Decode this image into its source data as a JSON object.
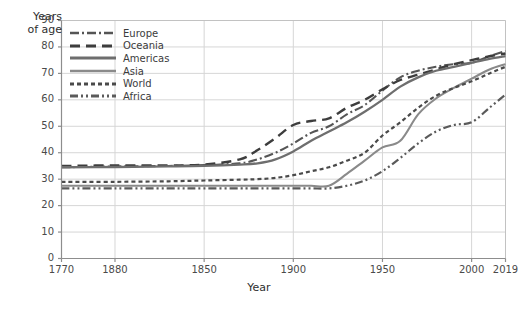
{
  "chart_data": {
    "type": "line",
    "title": "",
    "xlabel": "Year",
    "ylabel": "Years of age",
    "xlim": [
      1770,
      2019
    ],
    "ylim": [
      0,
      90
    ],
    "grid": true,
    "legend_position": "top-left inside plot",
    "x_ticks": [
      {
        "value": 1770,
        "label": "1770"
      },
      {
        "value": 1800,
        "label": "1880"
      },
      {
        "value": 1850,
        "label": "1850"
      },
      {
        "value": 1900,
        "label": "1900"
      },
      {
        "value": 1950,
        "label": "1950"
      },
      {
        "value": 2000,
        "label": "2000"
      },
      {
        "value": 2019,
        "label": "2019"
      }
    ],
    "y_ticks": [
      {
        "value": 0,
        "label": "0"
      },
      {
        "value": 10,
        "label": "10"
      },
      {
        "value": 20,
        "label": "20"
      },
      {
        "value": 30,
        "label": "30"
      },
      {
        "value": 40,
        "label": "40"
      },
      {
        "value": 50,
        "label": "50"
      },
      {
        "value": 60,
        "label": "60"
      },
      {
        "value": 70,
        "label": "70"
      },
      {
        "value": 80,
        "label": "80"
      },
      {
        "value": 90,
        "label": "90"
      }
    ],
    "x_gridlines": [
      1800,
      1850,
      1900,
      1950,
      2000
    ],
    "series": [
      {
        "name": "Europe",
        "color": "#555555",
        "dash": "9,3,2,3",
        "width": 2.1,
        "x": [
          1770,
          1800,
          1830,
          1850,
          1870,
          1880,
          1890,
          1900,
          1910,
          1920,
          1930,
          1940,
          1950,
          1960,
          1970,
          1980,
          1990,
          2000,
          2010,
          2019
        ],
        "values": [
          34.5,
          34.8,
          35.0,
          35.3,
          36.0,
          37.5,
          40.0,
          43.5,
          47.5,
          50.0,
          54.5,
          58.0,
          63.5,
          68.5,
          71.0,
          72.5,
          73.5,
          74.0,
          76.5,
          78.5
        ]
      },
      {
        "name": "Oceania",
        "color": "#3d3d3d",
        "dash": "10,6",
        "width": 2.4,
        "x": [
          1770,
          1800,
          1830,
          1850,
          1870,
          1880,
          1890,
          1900,
          1910,
          1920,
          1930,
          1940,
          1950,
          1960,
          1970,
          1980,
          1990,
          2000,
          2010,
          2019
        ],
        "values": [
          35.0,
          35.2,
          35.2,
          35.5,
          37.5,
          41.0,
          45.5,
          50.5,
          52.0,
          53.0,
          57.0,
          60.0,
          64.0,
          67.5,
          69.5,
          71.5,
          73.5,
          75.0,
          76.5,
          77.5
        ]
      },
      {
        "name": "Americas",
        "color": "#6e6e6e",
        "dash": "none",
        "width": 2.3,
        "x": [
          1770,
          1800,
          1830,
          1850,
          1870,
          1880,
          1890,
          1900,
          1910,
          1920,
          1930,
          1940,
          1950,
          1960,
          1970,
          1980,
          1990,
          2000,
          2010,
          2019
        ],
        "values": [
          34.5,
          34.6,
          34.8,
          35.0,
          35.5,
          36.0,
          37.5,
          40.5,
          44.5,
          48.0,
          51.5,
          55.5,
          60.0,
          65.0,
          68.5,
          71.0,
          72.5,
          74.0,
          75.5,
          76.5
        ]
      },
      {
        "name": "Asia",
        "color": "#8a8a8a",
        "dash": "none",
        "width": 2.1,
        "x": [
          1770,
          1800,
          1830,
          1850,
          1870,
          1880,
          1890,
          1900,
          1910,
          1920,
          1930,
          1940,
          1950,
          1960,
          1970,
          1980,
          1990,
          2000,
          2010,
          2019
        ],
        "values": [
          27.5,
          27.5,
          27.5,
          27.5,
          27.5,
          27.5,
          27.5,
          27.5,
          27.5,
          27.5,
          32.0,
          37.0,
          42.0,
          44.5,
          54.5,
          60.5,
          64.5,
          68.0,
          71.5,
          73.5
        ]
      },
      {
        "name": "World",
        "color": "#4a4a4a",
        "dash": "4,3",
        "width": 2.2,
        "x": [
          1770,
          1800,
          1830,
          1850,
          1870,
          1880,
          1890,
          1900,
          1910,
          1920,
          1930,
          1940,
          1950,
          1960,
          1970,
          1980,
          1990,
          2000,
          2010,
          2019
        ],
        "values": [
          29.0,
          29.0,
          29.2,
          29.5,
          29.8,
          30.0,
          30.5,
          31.5,
          33.0,
          34.5,
          37.0,
          40.0,
          46.5,
          51.5,
          57.0,
          61.5,
          64.5,
          67.0,
          70.0,
          72.5
        ]
      },
      {
        "name": "Africa",
        "color": "#5a5a5a",
        "dash": "8,3,2,3,2,3",
        "width": 2.2,
        "x": [
          1770,
          1800,
          1830,
          1850,
          1870,
          1880,
          1890,
          1900,
          1910,
          1920,
          1930,
          1940,
          1950,
          1960,
          1970,
          1980,
          1990,
          2000,
          2010,
          2019
        ],
        "values": [
          26.5,
          26.5,
          26.5,
          26.5,
          26.5,
          26.5,
          26.5,
          26.5,
          26.5,
          26.5,
          27.5,
          29.5,
          33.0,
          38.0,
          43.5,
          48.0,
          50.5,
          51.5,
          57.0,
          62.0
        ]
      }
    ]
  },
  "legend": {
    "items": [
      {
        "label": "Europe"
      },
      {
        "label": "Oceania"
      },
      {
        "label": "Americas"
      },
      {
        "label": "Asia"
      },
      {
        "label": "World"
      },
      {
        "label": "Africa"
      }
    ]
  },
  "axis_titles": {
    "y_line1": "Years",
    "y_line2": "of age",
    "x": "Year"
  }
}
